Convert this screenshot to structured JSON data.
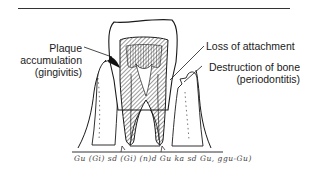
{
  "figure": {
    "type": "tooth-cross-section",
    "labels": {
      "plaque_line1": "Plaque",
      "plaque_line2": "accumulation",
      "plaque_line3": "(gingivitis)",
      "loss": "Loss of attachment",
      "bone_line1": "Destruction of bone",
      "bone_line2": "(periodontitis)"
    },
    "caption_scribble": "Gu (Gi) sd (Gi) (n)d Gu ka sd Gu, ggu-Gu)",
    "colors": {
      "ink": "#1a1a1a",
      "background": "#ffffff"
    }
  }
}
